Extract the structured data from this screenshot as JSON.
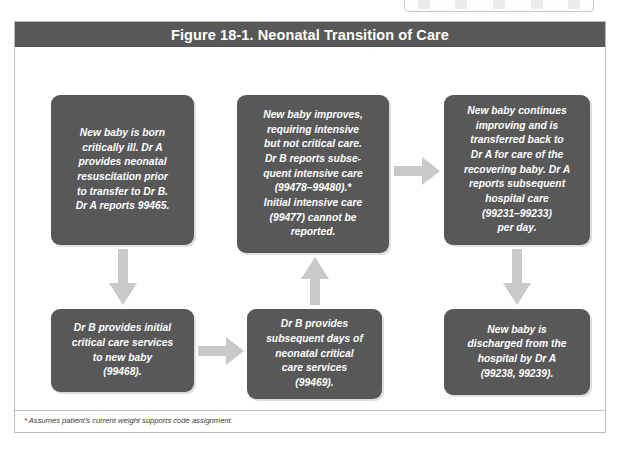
{
  "toolbar": {
    "icons": [
      "toolbar-icon-1",
      "toolbar-icon-2",
      "toolbar-icon-3",
      "toolbar-icon-4",
      "toolbar-icon-5"
    ]
  },
  "figure": {
    "title": "Figure 18-1. Neonatal Transition of Care",
    "footnote": "* Assumes patient's current weight supports code assignment.",
    "colors": {
      "title_bar": "#585858",
      "box_fill": "#585858",
      "box_text": "#ffffff",
      "arrow_fill": "#c9c9c9",
      "frame_border": "#b8b8b8",
      "page_background": "#ffffff"
    },
    "boxes": [
      {
        "id": "box-1",
        "text": "New baby is born\ncritically ill. Dr A\nprovides neonatal\nresuscitation prior\nto transfer to Dr B.\nDr A reports 99465."
      },
      {
        "id": "box-2",
        "text": "New baby improves,\nrequiring intensive\nbut not critical care.\nDr B reports subse-\nquent intensive care\n(99478–99480).*\nInitial intensive care\n(99477) cannot be\nreported."
      },
      {
        "id": "box-3",
        "text": "New baby continues\nimproving and is\ntransferred back to\nDr A for care of the\nrecovering baby. Dr A\nreports subsequent\nhospital care\n(99231–99233)\nper day."
      },
      {
        "id": "box-4",
        "text": "Dr B provides initial\ncritical care services\nto new baby\n(99468)."
      },
      {
        "id": "box-5",
        "text": "Dr B provides\nsubsequent days of\nneonatal critical\ncare services\n(99469)."
      },
      {
        "id": "box-6",
        "text": "New baby is\ndischarged from the\nhospital by Dr A\n(99238, 99239)."
      }
    ],
    "arrows": [
      {
        "id": "arrow-down-1",
        "direction": "down",
        "from": "box-1",
        "to": "box-4"
      },
      {
        "id": "arrow-right-1",
        "direction": "right",
        "from": "box-4",
        "to": "box-5"
      },
      {
        "id": "arrow-up-1",
        "direction": "up",
        "from": "box-5",
        "to": "box-2"
      },
      {
        "id": "arrow-right-2",
        "direction": "right",
        "from": "box-2",
        "to": "box-3"
      },
      {
        "id": "arrow-down-2",
        "direction": "down",
        "from": "box-3",
        "to": "box-6"
      }
    ]
  }
}
